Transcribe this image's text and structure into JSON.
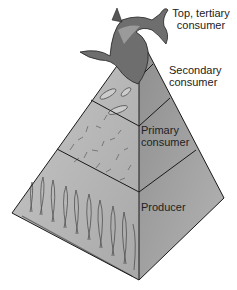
{
  "diagram": {
    "type": "ecological-pyramid",
    "levels": [
      {
        "id": "top",
        "label_line1": "Top, tertiary",
        "label_line2": "consumer",
        "organism": "shark"
      },
      {
        "id": "secondary",
        "label_line1": "Secondary",
        "label_line2": "consumer",
        "organism": "fish"
      },
      {
        "id": "primary",
        "label_line1": "Primary",
        "label_line2": "consumer",
        "organism": "zooplankton"
      },
      {
        "id": "producer",
        "label_line1": "Producer",
        "organism": "seaweed"
      }
    ],
    "colors": {
      "left_face": "#b8b8b8",
      "right_face": "#9a9a9a",
      "edge": "#1a1a1a",
      "background": "#ffffff"
    }
  }
}
